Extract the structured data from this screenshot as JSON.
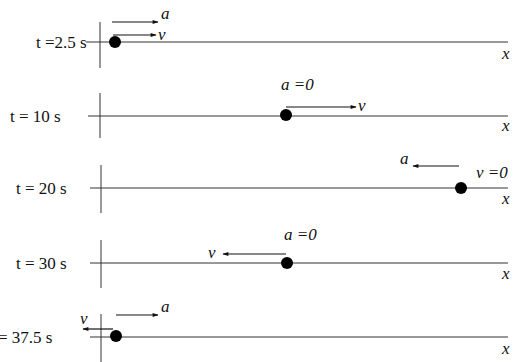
{
  "diagram": {
    "axis_label": "x",
    "rows": [
      {
        "time_label": "t =2.5 s",
        "y": 42,
        "dot_x": 115,
        "velocity": {
          "label": "v",
          "direction": "right",
          "x1": 114,
          "x2": 157,
          "y": 35
        },
        "acceleration": {
          "label": "a",
          "direction": "right",
          "x1": 112,
          "x2": 160,
          "y": 22
        }
      },
      {
        "time_label": "t = 10 s",
        "y": 116,
        "dot_x": 286,
        "velocity": {
          "label": "v",
          "direction": "right",
          "x1": 286,
          "x2": 357,
          "y": 107
        },
        "acceleration": {
          "label": "a =0"
        }
      },
      {
        "time_label": "t = 20 s",
        "y": 188,
        "dot_x": 460,
        "velocity": {
          "label": "v =0"
        },
        "acceleration": {
          "label": "a",
          "direction": "left",
          "x1": 459,
          "x2": 411,
          "y": 166
        }
      },
      {
        "time_label": "t = 30 s",
        "y": 263,
        "dot_x": 287,
        "velocity": {
          "label": "v",
          "direction": "left",
          "x1": 286,
          "x2": 221,
          "y": 254
        },
        "acceleration": {
          "label": "a =0"
        }
      },
      {
        "time_label": "= 37.5 s",
        "y": 337,
        "dot_x": 116,
        "velocity": {
          "label": "v",
          "direction": "left",
          "x1": 113,
          "x2": 81,
          "y": 329
        },
        "acceleration": {
          "label": "a",
          "direction": "right",
          "x1": 116,
          "x2": 160,
          "y": 315
        }
      }
    ]
  }
}
